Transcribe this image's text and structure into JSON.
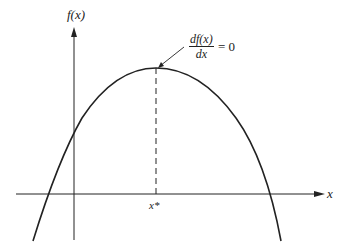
{
  "diagram": {
    "y_axis_label": "f(x)",
    "x_axis_label": "x",
    "optimum_label": "x*",
    "annotation": {
      "numerator": "df(x)",
      "denominator": "dx",
      "equals": "= 0"
    },
    "colors": {
      "line": "#222222",
      "background": "#ffffff"
    }
  }
}
